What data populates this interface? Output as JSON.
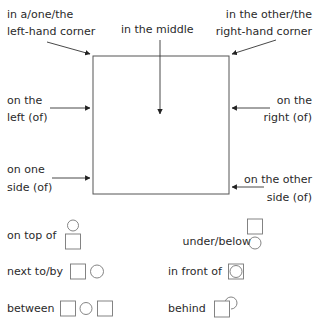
{
  "diagram": {
    "box_labels": {
      "top_left_corner": [
        "in a/one/the",
        "left-hand corner"
      ],
      "middle": "in the middle",
      "top_right_corner": [
        "in the other/the",
        "right-hand corner"
      ],
      "left": [
        "on the",
        "left (of)"
      ],
      "right": [
        "on the",
        "right (of)"
      ],
      "one_side": [
        "on one",
        "side (of)"
      ],
      "other_side": [
        "on the other",
        "side (of)"
      ]
    },
    "shape_labels": {
      "on_top_of": "on top of",
      "under_below": "under/below",
      "next_to_by": "next to/by",
      "in_front_of": "in front of",
      "between": "between",
      "behind": "behind"
    },
    "colors": {
      "text": "#2a2a2a",
      "line": "#555555",
      "shape": "#777777"
    }
  }
}
